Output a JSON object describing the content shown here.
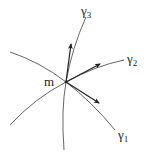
{
  "diagram": {
    "point_label": "m",
    "curves": [
      {
        "name": "gamma1",
        "label": "γ",
        "subscript": "1"
      },
      {
        "name": "gamma2",
        "label": "γ",
        "subscript": "2"
      },
      {
        "name": "gamma3",
        "label": "γ",
        "subscript": "3"
      }
    ],
    "colors": {
      "curve": "#555555",
      "arrow": "#222222",
      "text": "#222222"
    }
  }
}
